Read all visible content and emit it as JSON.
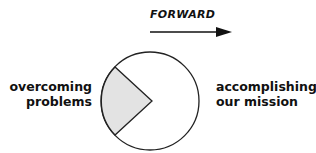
{
  "diagram": {
    "direction_label": "FORWARD",
    "left_label_line1": "overcoming",
    "left_label_line2": "problems",
    "right_label_line1": "accomplishing",
    "right_label_line2": "our mission",
    "colors": {
      "wedge_fill": "#e3e3e3",
      "stroke": "#222222",
      "background": "#ffffff"
    }
  }
}
